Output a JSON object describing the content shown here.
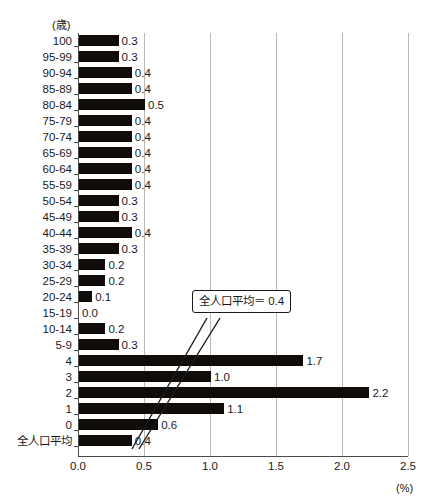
{
  "axes": {
    "y_unit_label": "(歳)",
    "x_unit_label": "(%)",
    "x_ticks": [
      "0.0",
      "0.5",
      "1.0",
      "1.5",
      "2.0",
      "2.5"
    ],
    "x_min": 0.0,
    "x_max": 2.5
  },
  "annotation": {
    "label": "全人口平均＝ 0.4"
  },
  "chart_data": {
    "type": "bar",
    "orientation": "horizontal",
    "title": "",
    "xlabel": "(%)",
    "ylabel": "(歳)",
    "xlim": [
      0.0,
      2.5
    ],
    "grid": true,
    "legend": false,
    "categories": [
      "100",
      "95-99",
      "90-94",
      "85-89",
      "80-84",
      "75-79",
      "70-74",
      "65-69",
      "60-64",
      "55-59",
      "50-54",
      "45-49",
      "40-44",
      "35-39",
      "30-34",
      "25-29",
      "20-24",
      "15-19",
      "10-14",
      "5-9",
      "4",
      "3",
      "2",
      "1",
      "0",
      "全人口平均"
    ],
    "values": [
      0.3,
      0.3,
      0.4,
      0.4,
      0.5,
      0.4,
      0.4,
      0.4,
      0.4,
      0.4,
      0.3,
      0.3,
      0.4,
      0.3,
      0.2,
      0.2,
      0.1,
      0.0,
      0.2,
      0.3,
      1.7,
      1.0,
      2.2,
      1.1,
      0.6,
      0.4
    ],
    "value_labels": [
      "0.3",
      "0.3",
      "0.4",
      "0.4",
      "0.5",
      "0.4",
      "0.4",
      "0.4",
      "0.4",
      "0.4",
      "0.3",
      "0.3",
      "0.4",
      "0.3",
      "0.2",
      "0.2",
      "0.1",
      "0.0",
      "0.2",
      "0.3",
      "1.7",
      "1.0",
      "2.2",
      "1.1",
      "0.6",
      "0.4"
    ],
    "annotations": [
      {
        "text": "全人口平均＝ 0.4",
        "points_to_category": "全人口平均"
      }
    ],
    "bar_color": "#100c0a",
    "grid_color": "#b9b9b9"
  }
}
